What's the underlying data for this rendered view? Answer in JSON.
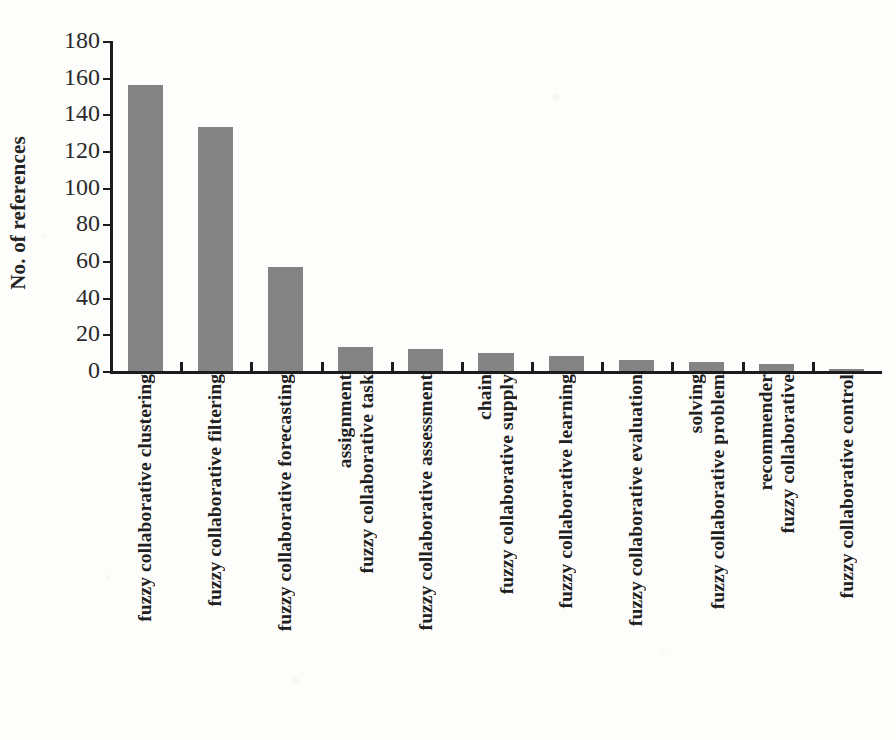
{
  "chart_data": {
    "type": "bar",
    "title": "",
    "xlabel": "",
    "ylabel": "No. of references",
    "ylim": [
      0,
      180
    ],
    "ytick_step": 20,
    "yticks": [
      180,
      160,
      140,
      120,
      100,
      80,
      60,
      40,
      20,
      0
    ],
    "grid": false,
    "legend": "none",
    "orientation": "vertical",
    "bar_color": "#848484",
    "axis_color": "#1c1c1c",
    "categories": [
      "fuzzy collaborative clustering",
      "fuzzy collaborative filtering",
      "fuzzy collaborative forecasting",
      "fuzzy collaborative task assignment",
      "fuzzy collaborative assessment",
      "fuzzy collaborative supply chain",
      "fuzzy collaborative learning",
      "fuzzy collaborative evaluation",
      "fuzzy collaborative problem solving",
      "fuzzy collaborative recommender",
      "fuzzy collaborative control"
    ],
    "category_lines": [
      [
        "fuzzy collaborative clustering"
      ],
      [
        "fuzzy collaborative filtering"
      ],
      [
        "fuzzy collaborative forecasting"
      ],
      [
        "fuzzy collaborative task",
        "assignment"
      ],
      [
        "fuzzy collaborative assessment"
      ],
      [
        "fuzzy collaborative supply",
        "chain"
      ],
      [
        "fuzzy collaborative learning"
      ],
      [
        "fuzzy collaborative evaluation"
      ],
      [
        "fuzzy collaborative problem",
        "solving"
      ],
      [
        "fuzzy collaborative",
        "recommender"
      ],
      [
        "fuzzy collaborative control"
      ]
    ],
    "values": [
      156,
      133,
      57,
      13,
      12,
      10,
      8,
      6,
      5,
      4,
      1
    ]
  }
}
